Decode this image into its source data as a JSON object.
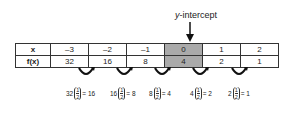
{
  "annotation": {
    "label_italic": "y",
    "label_rest": "-intercept"
  },
  "table": {
    "rows": [
      {
        "header": "x",
        "values": [
          "–3",
          "–2",
          "–1",
          "0",
          "1",
          "2"
        ]
      },
      {
        "header": "f(x)",
        "values": [
          "32",
          "16",
          "8",
          "4",
          "2",
          "1"
        ]
      }
    ],
    "highlight_column": 3,
    "highlight_color": "#aaaaaa"
  },
  "equations": [
    {
      "base": "32",
      "num": "1",
      "den": "2",
      "result": "= 16"
    },
    {
      "base": "16",
      "num": "1",
      "den": "2",
      "result": "= 8"
    },
    {
      "base": "8",
      "num": "1",
      "den": "2",
      "result": "= 4"
    },
    {
      "base": "4",
      "num": "1",
      "den": "2",
      "result": "= 2"
    },
    {
      "base": "2",
      "num": "1",
      "den": "2",
      "result": "= 1"
    }
  ]
}
